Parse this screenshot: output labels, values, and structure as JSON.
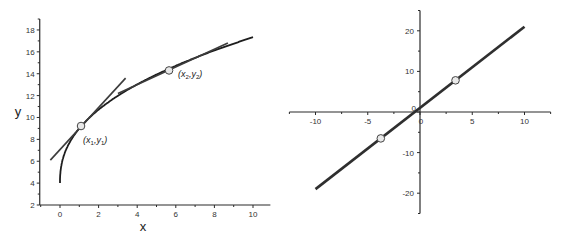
{
  "chart_data": [
    {
      "type": "line",
      "title": "",
      "xlabel": "x",
      "ylabel": "y",
      "xlim": [
        -1.05,
        10.9
      ],
      "ylim": [
        2,
        19
      ],
      "grid": false,
      "legend": null,
      "xticks": [
        0,
        2,
        4,
        6,
        8,
        10
      ],
      "yticks": [
        2,
        4,
        6,
        8,
        10,
        12,
        14,
        16,
        18
      ],
      "series": [
        {
          "name": "curve",
          "equation_approx": "y = 4 + 5.0 * x^0.426",
          "x": [
            0,
            0.05,
            0.1,
            0.2,
            0.4,
            0.7,
            1.1,
            1.6,
            2.2,
            3,
            4,
            5,
            5.65,
            6.5,
            7.5,
            8.5,
            10
          ],
          "y": [
            4,
            5.4,
            5.9,
            6.5,
            7.4,
            8.3,
            9.2,
            10.1,
            10.9,
            11.8,
            12.7,
            13.5,
            14.3,
            14.7,
            15.4,
            16.0,
            17.2
          ]
        },
        {
          "name": "tangent-1",
          "x": [
            -0.5,
            3.4
          ],
          "y": [
            6.1,
            13.6
          ]
        },
        {
          "name": "tangent-2",
          "x": [
            3.0,
            8.7
          ],
          "y": [
            12.2,
            16.8
          ]
        }
      ],
      "points": [
        {
          "label_main": "(x",
          "sub1": "1",
          "mid": ",y",
          "sub2": "1",
          "end": ")",
          "x": 1.09,
          "y": 9.22
        },
        {
          "label_main": "(x",
          "sub1": "2",
          "mid": ",y",
          "sub2": "2",
          "end": ")",
          "x": 5.65,
          "y": 14.3
        }
      ]
    },
    {
      "type": "line",
      "title": "",
      "xlabel": "",
      "ylabel": "",
      "xlim": [
        -12.5,
        12.5
      ],
      "ylim": [
        -25,
        25
      ],
      "grid": false,
      "legend": null,
      "axes_through_origin": true,
      "xticks": [
        -10,
        -5,
        0,
        5,
        10
      ],
      "yticks": [
        -20,
        -10,
        0,
        10,
        20
      ],
      "series": [
        {
          "name": "line",
          "equation_approx": "y = 2x + 1",
          "x": [
            -10,
            10
          ],
          "y": [
            -19,
            21
          ]
        }
      ],
      "points": [
        {
          "x": -3.75,
          "y": -6.5
        },
        {
          "x": 3.4,
          "y": 7.8
        }
      ]
    }
  ]
}
